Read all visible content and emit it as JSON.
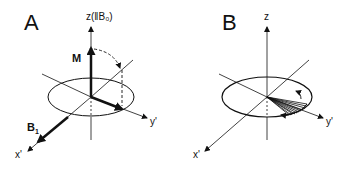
{
  "panels": [
    {
      "label": "A",
      "axes": {
        "z": "z(‖B₀)",
        "x": "x'",
        "y": "y'"
      },
      "vectors": {
        "magnetization": "M",
        "rf_field": "B",
        "rf_field_sub": "1"
      }
    },
    {
      "label": "B",
      "axes": {
        "z": "z",
        "x": "x'",
        "y": "y'"
      }
    }
  ],
  "colors": {
    "ink": "#111111",
    "background": "#ffffff"
  }
}
